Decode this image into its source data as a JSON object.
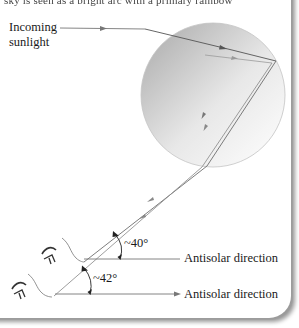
{
  "figure": {
    "top_text_fragment": "sky is seen as a bright arc with a primary rainbow",
    "incoming_label_line1": "Incoming",
    "incoming_label_line2": "sunlight",
    "angle_upper": "~40°",
    "angle_lower": "~42°",
    "antisolar_upper": "Antisolar direction",
    "antisolar_lower": "Antisolar direction",
    "icons": {
      "observer_upper": "eye-icon",
      "observer_lower": "eye-icon",
      "raindrop": "raindrop-circle"
    },
    "colors": {
      "ray_dark": "#555555",
      "ray_light": "#8a8a8a",
      "drop_edge": "#bdbdbd",
      "text": "#1a1a1a",
      "shadow": "#9a9a9a"
    }
  }
}
